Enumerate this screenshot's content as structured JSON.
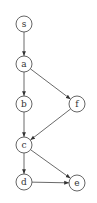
{
  "diagram": {
    "type": "directed-graph",
    "nodes": [
      {
        "id": "s",
        "label": "s",
        "x": 24,
        "y": 24
      },
      {
        "id": "a",
        "label": "a",
        "x": 24,
        "y": 64
      },
      {
        "id": "b",
        "label": "b",
        "x": 24,
        "y": 104
      },
      {
        "id": "f",
        "label": "f",
        "x": 77,
        "y": 104
      },
      {
        "id": "c",
        "label": "c",
        "x": 24,
        "y": 145
      },
      {
        "id": "d",
        "label": "d",
        "x": 24,
        "y": 182
      },
      {
        "id": "e",
        "label": "e",
        "x": 77,
        "y": 183
      }
    ],
    "edges": [
      {
        "from": "s",
        "to": "a"
      },
      {
        "from": "a",
        "to": "b"
      },
      {
        "from": "a",
        "to": "f"
      },
      {
        "from": "b",
        "to": "c"
      },
      {
        "from": "f",
        "to": "c"
      },
      {
        "from": "c",
        "to": "d"
      },
      {
        "from": "c",
        "to": "e"
      },
      {
        "from": "d",
        "to": "e"
      }
    ]
  }
}
